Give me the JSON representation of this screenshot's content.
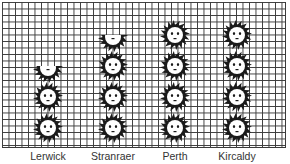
{
  "chart_data": {
    "type": "pictogram",
    "title": "",
    "xlabel": "",
    "ylabel": "",
    "icon": "sun-icon",
    "categories": [
      "Lerwick",
      "Stranraer",
      "Perth",
      "Kircaldy"
    ],
    "values": [
      2.5,
      3.5,
      4,
      4
    ],
    "grid": true,
    "legend": null
  },
  "labels": {
    "lerwick": "Lerwick",
    "stranraer": "Stranraer",
    "perth": "Perth",
    "kircaldy": "Kircaldy"
  },
  "colors": {
    "icon": "#1a1a1a",
    "face": "#ffffff",
    "grid": "#3a3a3a"
  }
}
